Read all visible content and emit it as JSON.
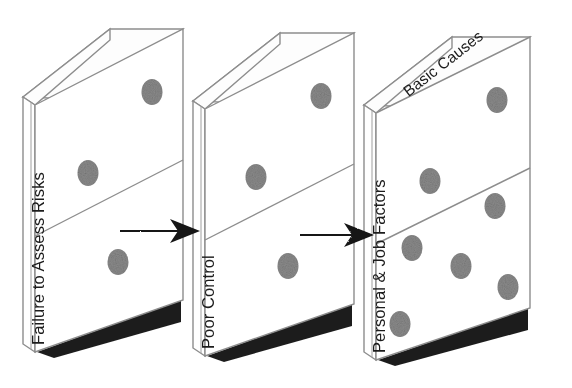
{
  "diagram": {
    "type": "domino-sequence",
    "background_color": "#ffffff",
    "ink_color": "#1a1a1a",
    "outline_color": "#8d8d8d",
    "pip_color": "#8a8a8a",
    "shadow_color": "#1e1e1e"
  },
  "dominoes": [
    {
      "id": "domino-1",
      "spine_label": "Failure to Assess Risks",
      "top_label": "",
      "pips_top_half": 2,
      "pips_bottom_half": 1
    },
    {
      "id": "domino-2",
      "spine_label": "Poor Control",
      "top_label": "",
      "pips_top_half": 2,
      "pips_bottom_half": 1
    },
    {
      "id": "domino-3",
      "spine_label": "Personal & Job Factors",
      "top_label": "Basic Causes",
      "pips_top_half": 2,
      "pips_bottom_half": 5
    }
  ],
  "connectors": [
    {
      "id": "arrow-1",
      "from": "domino-1",
      "to": "domino-2",
      "direction": "right",
      "icon": "arrow-right-icon"
    },
    {
      "id": "arrow-2",
      "from": "domino-2",
      "to": "domino-3",
      "direction": "right",
      "icon": "arrow-right-icon"
    }
  ]
}
